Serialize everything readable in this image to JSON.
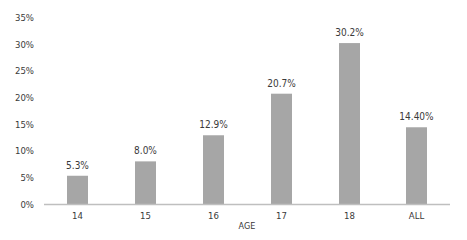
{
  "chart_data": {
    "type": "bar",
    "title": "",
    "xlabel": "AGE",
    "ylabel": "",
    "categories": [
      "14",
      "15",
      "16",
      "17",
      "18",
      "ALL"
    ],
    "values": [
      5.3,
      8.0,
      12.9,
      20.7,
      30.2,
      14.4
    ],
    "data_labels": [
      "5.3%",
      "8.0%",
      "12.9%",
      "20.7%",
      "30.2%",
      "14.40%"
    ],
    "yticks": [
      0,
      5,
      10,
      15,
      20,
      25,
      30,
      35
    ],
    "ytick_labels": [
      "0%",
      "5%",
      "10%",
      "15%",
      "20%",
      "25%",
      "30%",
      "35%"
    ],
    "ylim": [
      0,
      35
    ],
    "grid": false,
    "legend": "none",
    "colors": {
      "bar": "#a6a6a6",
      "axis": "#bfbfbf",
      "text": "#3a3a3a"
    }
  }
}
